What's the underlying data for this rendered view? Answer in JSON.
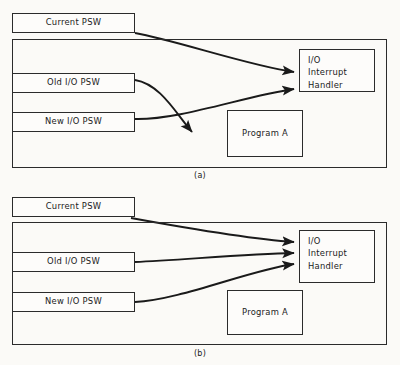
{
  "figure": {
    "background_color": "#fbfaf7",
    "line_color": "#2b2b2b",
    "box_fill": "#fdfcfa"
  },
  "panels": [
    {
      "id": "a",
      "caption": "(a)",
      "current_psw": {
        "label": "Current PSW"
      },
      "old_psw": {
        "label": "Old I/O PSW"
      },
      "new_psw": {
        "label": "New I/O PSW"
      },
      "handler": {
        "line1": "I/O",
        "line2": "Interrupt",
        "line3": "Handler"
      },
      "program": {
        "label": "Program A"
      },
      "arrows": [
        {
          "name": "current-psw-to-handler",
          "from": "Current PSW",
          "to": "I/O Interrupt Handler"
        },
        {
          "name": "old-psw-to-program-a",
          "from": "Old I/O PSW",
          "to": "Program A"
        },
        {
          "name": "new-psw-to-handler",
          "from": "New I/O PSW",
          "to": "I/O Interrupt Handler"
        }
      ]
    },
    {
      "id": "b",
      "caption": "(b)",
      "current_psw": {
        "label": "Current PSW"
      },
      "old_psw": {
        "label": "Old I/O PSW"
      },
      "new_psw": {
        "label": "New I/O PSW"
      },
      "handler": {
        "line1": "I/O",
        "line2": "Interrupt",
        "line3": "Handler"
      },
      "program": {
        "label": "Program A"
      },
      "arrows": [
        {
          "name": "current-psw-to-handler",
          "from": "Current PSW",
          "to": "I/O Interrupt Handler"
        },
        {
          "name": "old-psw-to-handler",
          "from": "Old I/O PSW",
          "to": "I/O Interrupt Handler"
        },
        {
          "name": "new-psw-to-handler",
          "from": "New I/O PSW",
          "to": "I/O Interrupt Handler"
        }
      ]
    }
  ]
}
